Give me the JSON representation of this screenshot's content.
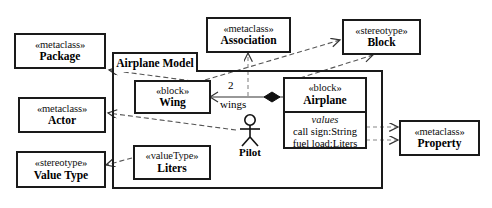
{
  "diagram": {
    "title": "Airplane Model",
    "package_frame_label": "Airplane Model",
    "stroke_color": "#1a1a1a",
    "background_color": "#ffffff"
  },
  "nodes": {
    "metaclass_package": {
      "stereotype": "«metaclass»",
      "name": "Package"
    },
    "metaclass_actor": {
      "stereotype": "«metaclass»",
      "name": "Actor"
    },
    "stereotype_value_type": {
      "stereotype": "«stereotype»",
      "name": "Value Type"
    },
    "metaclass_association": {
      "stereotype": "«metaclass»",
      "name": "Association"
    },
    "stereotype_block": {
      "stereotype": "«stereotype»",
      "name": "Block"
    },
    "metaclass_property": {
      "stereotype": "«metaclass»",
      "name": "Property"
    },
    "block_wing": {
      "stereotype": "«block»",
      "name": "Wing"
    },
    "block_airplane": {
      "stereotype": "«block»",
      "name": "Airplane",
      "compartment_label": "values",
      "values": [
        "call sign:String",
        "fuel load:Liters"
      ]
    },
    "valuetype_liters": {
      "stereotype": "«valueType»",
      "name": "Liters"
    },
    "actor_pilot": {
      "name": "Pilot"
    }
  },
  "association": {
    "multiplicity": "2",
    "role_name": "wings"
  }
}
